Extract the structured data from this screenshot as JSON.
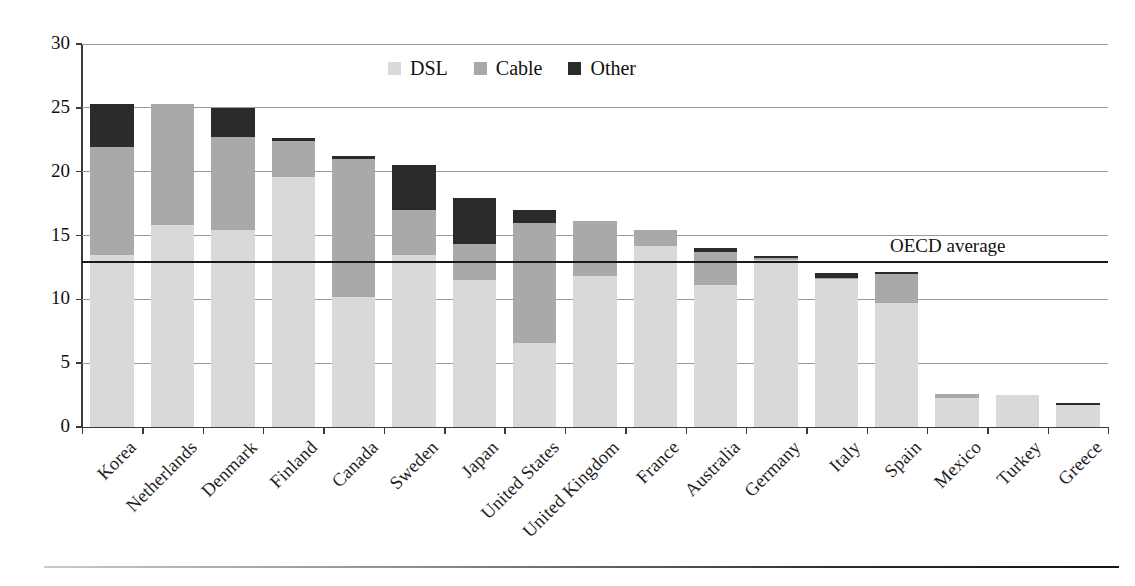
{
  "chart_data": {
    "type": "bar",
    "stacked": true,
    "title": "",
    "subtitle": "",
    "xlabel": "",
    "ylabel": "",
    "ylim": [
      0,
      30
    ],
    "yticks": [
      0,
      5,
      10,
      15,
      20,
      25,
      30
    ],
    "ytick_labels": [
      "0",
      "5",
      "10",
      "15",
      "20",
      "25",
      "30"
    ],
    "grid": "horizontal",
    "legend_position": "top-center",
    "categories": [
      "Korea",
      "Netherlands",
      "Denmark",
      "Finland",
      "Canada",
      "Sweden",
      "Japan",
      "United States",
      "United Kingdom",
      "France",
      "Australia",
      "Germany",
      "Italy",
      "Spain",
      "Mexico",
      "Turkey",
      "Greece"
    ],
    "series": [
      {
        "name": "DSL",
        "color": "#d9d9d9",
        "values": [
          13.5,
          15.8,
          15.4,
          19.6,
          10.2,
          13.5,
          11.5,
          6.6,
          11.8,
          14.2,
          11.1,
          13.1,
          11.6,
          9.7,
          2.3,
          2.5,
          1.7
        ]
      },
      {
        "name": "Cable",
        "color": "#a9a9a9",
        "values": [
          8.4,
          9.5,
          7.3,
          2.8,
          10.8,
          3.5,
          2.8,
          9.4,
          4.3,
          1.2,
          2.6,
          0.1,
          0.1,
          2.3,
          0.3,
          0.0,
          0.0
        ]
      },
      {
        "name": "Other",
        "color": "#2b2b2b",
        "values": [
          3.4,
          0.0,
          2.3,
          0.2,
          0.2,
          3.5,
          3.6,
          1.0,
          0.0,
          0.0,
          0.3,
          0.2,
          0.4,
          0.1,
          0.0,
          0.0,
          0.2
        ]
      }
    ],
    "totals": [
      25.3,
      25.3,
      25.0,
      22.6,
      21.2,
      20.5,
      17.9,
      17.0,
      16.1,
      15.4,
      14.0,
      13.4,
      12.1,
      12.1,
      2.6,
      2.5,
      1.9
    ],
    "annotations": [
      {
        "name": "oecd-average",
        "label": "OECD average",
        "type": "hline",
        "value": 13.0
      }
    ]
  },
  "legend": {
    "items": [
      {
        "label": "DSL",
        "color": "#d9d9d9"
      },
      {
        "label": "Cable",
        "color": "#a9a9a9"
      },
      {
        "label": "Other",
        "color": "#2b2b2b"
      }
    ]
  }
}
